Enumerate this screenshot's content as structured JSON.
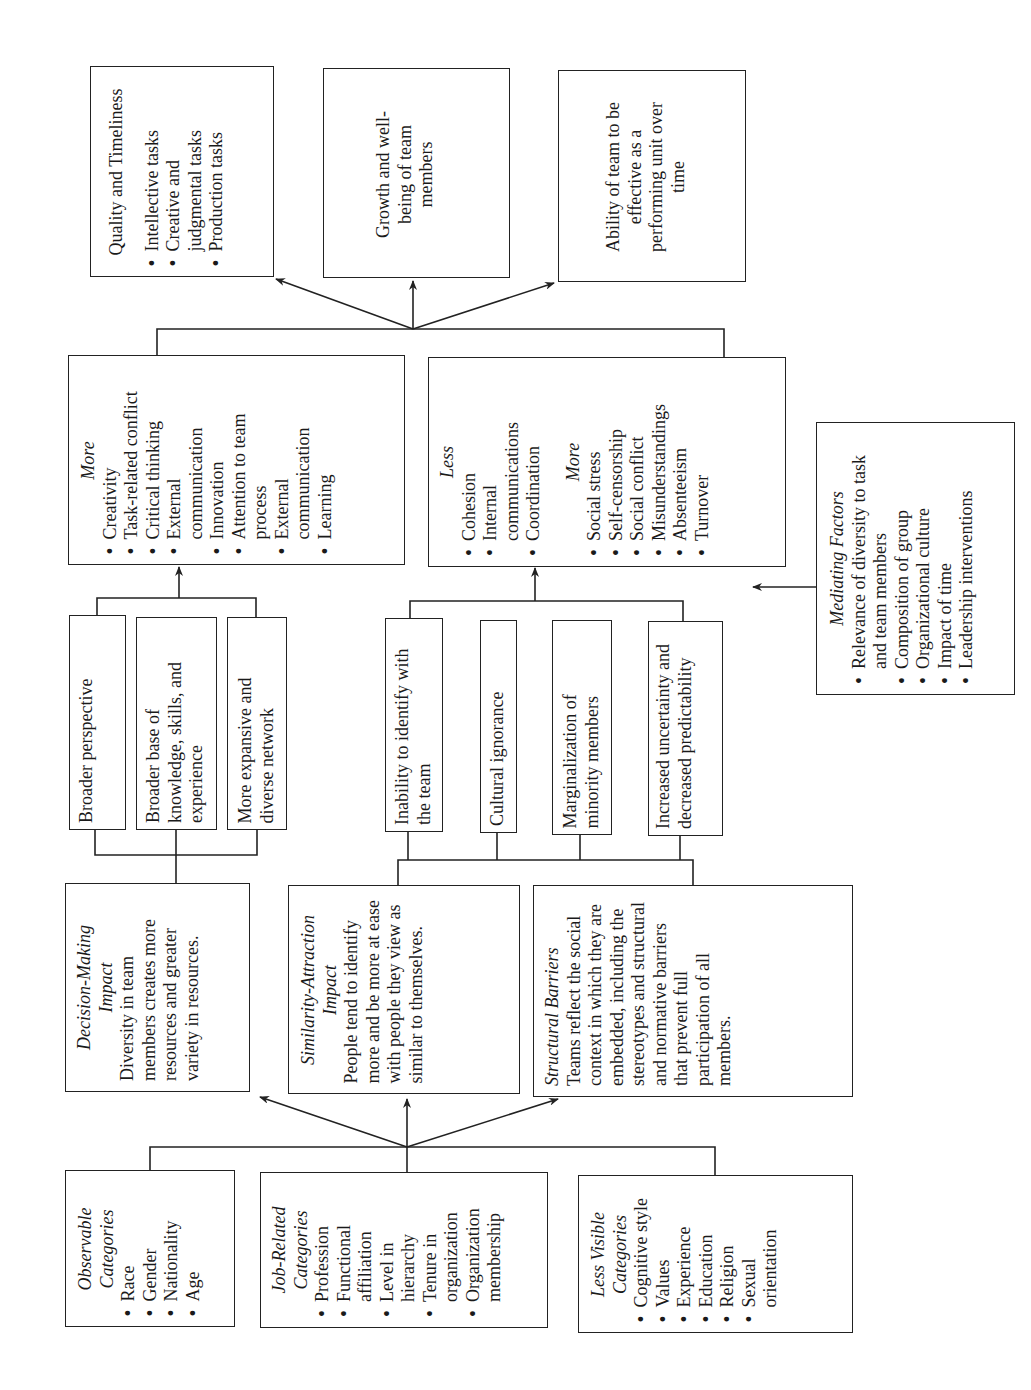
{
  "inputs": {
    "observable": {
      "title": "Observable Categories",
      "items": [
        "Race",
        "Gender",
        "Nationality",
        "Age"
      ]
    },
    "job_related": {
      "title": "Job-Related Categories",
      "items": [
        "Profession",
        "Functional affiliation",
        "Level in hierarchy",
        "Tenure in organization",
        "Organization membership"
      ]
    },
    "less_visible": {
      "title": "Less Visible Categories",
      "items": [
        "Cognitive style",
        "Values",
        "Experience",
        "Education",
        "Religion",
        "Sexual orientation"
      ]
    }
  },
  "impacts": {
    "decision_making": {
      "title_line1": "Decision-Making",
      "title_line2": "Impact",
      "text": "Diversity in team members creates more resources and greater variety in resources."
    },
    "similarity_attraction": {
      "title_line1": "Similarity-Attraction",
      "title_line2": "Impact",
      "text": "People tend to identify more and be more at ease with people they view as similar to themselves."
    },
    "structural_barriers": {
      "title": "Structural Barriers",
      "text": "Teams reflect the social context in which they are embedded, including the stereotypes and structural and normative barriers that prevent full participation of all members."
    }
  },
  "benefits": [
    "Broader perspective",
    "Broader base of knowledge, skills, and experience",
    "More expansive and diverse network"
  ],
  "barriers": [
    "Inability to identify with the team",
    "Cultural ignorance",
    "Marginalization of minority members",
    "Increased uncertainty and decreased predictability"
  ],
  "processes": {
    "more_box": {
      "title": "More",
      "items": [
        "Creativity",
        "Task-related conflict",
        "Critical thinking",
        "External communication",
        "Innovation",
        "Attention to team process",
        "External communication",
        "Learning"
      ]
    },
    "less_more_box": {
      "less_title": "Less",
      "less_items": [
        "Cohesion",
        "Internal communications",
        "Coordination"
      ],
      "more_title": "More",
      "more_items": [
        "Social stress",
        "Self-censorship",
        "Social conflict",
        "Misunderstandings",
        "Absenteeism",
        "Turnover"
      ]
    }
  },
  "mediating": {
    "title": "Mediating Factors",
    "items": [
      "Relevance of diversity to task and team members",
      "Composition of group",
      "Organizational culture",
      "Impact of time",
      "Leadership interventions"
    ]
  },
  "outcomes": {
    "quality": {
      "title": "Quality and Timeliness",
      "items": [
        "Intellective tasks",
        "Creative and judgmental tasks",
        "Production tasks"
      ]
    },
    "growth": {
      "text": "Growth and well-being of team members"
    },
    "ability": {
      "text": "Ability of team to be effective as a performing unit over time"
    }
  },
  "colors": {
    "line": "#222222",
    "background": "#ffffff",
    "text": "#1a1a1a"
  }
}
